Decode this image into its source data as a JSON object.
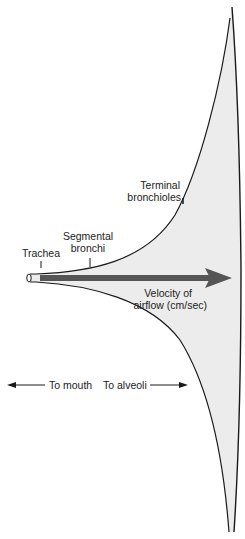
{
  "diagram": {
    "labels": {
      "trachea": "Trachea",
      "segmental_line1": "Segmental",
      "segmental_line2": "bronchi",
      "terminal_line1": "Terminal",
      "terminal_line2": "bronchioles",
      "velocity_line1": "Velocity of",
      "velocity_line2": "airflow (cm/sec)",
      "to_mouth": "To mouth",
      "to_alveoli": "To alveoli"
    },
    "colors": {
      "airway_fill": "#ececec",
      "outline": "#1a1a1a",
      "velocity_arrow": "#555555",
      "text": "#222222"
    }
  }
}
